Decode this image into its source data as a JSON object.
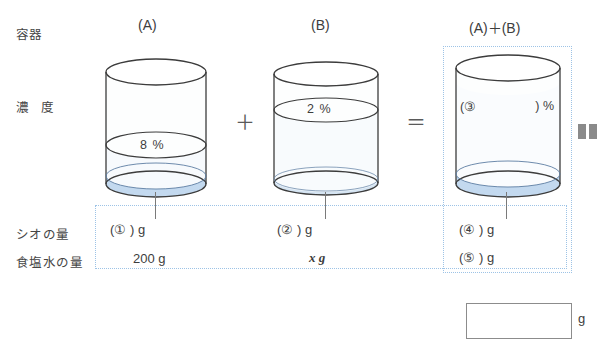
{
  "row_labels": {
    "container": "容器",
    "concentration": "濃 度",
    "salt_amount": "シオの量",
    "brine_amount": "食塩水の量"
  },
  "columns": [
    {
      "header": "(A)",
      "percent": "8 %",
      "salt": "(①        ) g",
      "brine": "200 g"
    },
    {
      "header": "(B)",
      "percent": "2 %",
      "salt": "(②        ) g",
      "brine": "x g"
    },
    {
      "header": "(A)＋(B)",
      "percent_open": "(③",
      "percent_close": ") %",
      "salt": "(④        ) g",
      "brine": "(⑤        ) g"
    }
  ],
  "operators": {
    "plus": "＋",
    "equals": "＝"
  },
  "answer": {
    "value": "",
    "unit": "g"
  },
  "colors": {
    "outline": "#3c3c3c",
    "liquid_fill": "#fbfcfe",
    "salt_layer": "#c3d9ef",
    "dotted_border": "#9dc3e6",
    "text": "#3d3d3d",
    "glyph_gray": "#8a8a8a"
  },
  "icons": {
    "pause": "pause-icon"
  }
}
